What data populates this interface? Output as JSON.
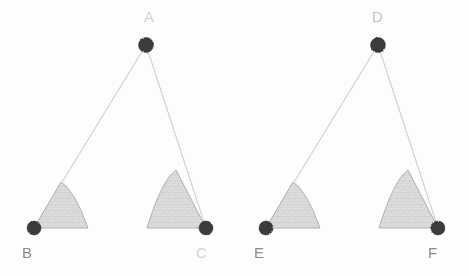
{
  "figure": {
    "background_color": "#fdfdfd",
    "ink_color": "#c9c9c9",
    "base_line_color": "#7c7c7c",
    "wedge_fill_color": "#d9d9d9",
    "wedge_stroke_color": "#a9a9a9",
    "vertex_dot_color": "#3a3a3a",
    "label_color": "#8e8e8e"
  },
  "triangles": [
    {
      "name": "triangle-abc",
      "vertices": [
        {
          "label": "A",
          "role": "apex",
          "x": 146,
          "y": 45,
          "label_x": 144,
          "label_y": 22,
          "label_tone": "veryfaint",
          "dot_r": 7.5
        },
        {
          "label": "B",
          "role": "base-left",
          "x": 34,
          "y": 228,
          "label_x": 22,
          "label_y": 258,
          "label_tone": "dark",
          "dot_r": 7.0
        },
        {
          "label": "C",
          "role": "base-right",
          "x": 206,
          "y": 228,
          "label_x": 196,
          "label_y": 258,
          "label_tone": "veryfaint",
          "dot_r": 7.0
        }
      ],
      "edges": [
        {
          "name": "edge-ab",
          "from": "A",
          "to": "B",
          "style": "faded"
        },
        {
          "name": "edge-ac",
          "from": "A",
          "to": "C",
          "style": "faded"
        },
        {
          "name": "edge-bc",
          "from": "B",
          "to": "C",
          "style": "base"
        }
      ],
      "angle_marks": [
        {
          "name": "angle-mark-b",
          "at": "B",
          "radius": 54,
          "peak_y": 182,
          "far_x": 88,
          "direction": "right"
        },
        {
          "name": "angle-mark-c",
          "at": "C",
          "radius": 60,
          "peak_y": 170,
          "far_x": 147,
          "direction": "left"
        }
      ]
    },
    {
      "name": "triangle-def",
      "vertices": [
        {
          "label": "D",
          "role": "apex",
          "x": 378,
          "y": 45,
          "label_x": 372,
          "label_y": 22,
          "label_tone": "faint",
          "dot_r": 7.5
        },
        {
          "label": "E",
          "role": "base-left",
          "x": 266,
          "y": 228,
          "label_x": 254,
          "label_y": 258,
          "label_tone": "dark",
          "dot_r": 7.0
        },
        {
          "label": "F",
          "role": "base-right",
          "x": 438,
          "y": 228,
          "label_x": 428,
          "label_y": 258,
          "label_tone": "dark",
          "dot_r": 7.0
        }
      ],
      "edges": [
        {
          "name": "edge-de",
          "from": "D",
          "to": "E",
          "style": "faded"
        },
        {
          "name": "edge-df",
          "from": "D",
          "to": "F",
          "style": "faded"
        },
        {
          "name": "edge-ef",
          "from": "E",
          "to": "F",
          "style": "base"
        }
      ],
      "angle_marks": [
        {
          "name": "angle-mark-e",
          "at": "E",
          "radius": 54,
          "peak_y": 182,
          "far_x": 320,
          "direction": "right"
        },
        {
          "name": "angle-mark-f",
          "at": "F",
          "radius": 60,
          "peak_y": 170,
          "far_x": 379,
          "direction": "left"
        }
      ]
    }
  ]
}
